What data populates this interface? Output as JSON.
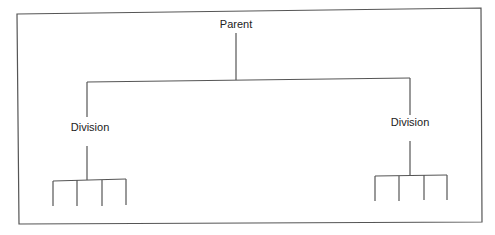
{
  "diagram": {
    "type": "org-chart",
    "root": {
      "label": "Parent",
      "children": [
        {
          "label": "Division",
          "sub_units": 4
        },
        {
          "label": "Division",
          "sub_units": 4
        }
      ]
    }
  },
  "colors": {
    "line": "#555555",
    "text": "#222222",
    "background": "#ffffff"
  }
}
